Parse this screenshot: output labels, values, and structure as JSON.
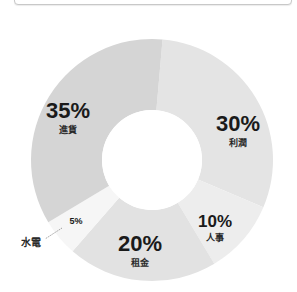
{
  "chart_data": {
    "type": "pie",
    "variant": "donut",
    "title": "",
    "categories": [
      "利潤",
      "人事",
      "租金",
      "水電",
      "進貨"
    ],
    "values": [
      30,
      10,
      20,
      5,
      35
    ],
    "unit": "%",
    "labels": [
      "30%",
      "10%",
      "20%",
      "5%",
      "35%"
    ],
    "colors": [
      "#e4e4e4",
      "#ededed",
      "#e2e2e2",
      "#f6f6f6",
      "#d5d5d5"
    ],
    "start_angle_deg": 5,
    "direction": "clockwise",
    "legend": "none",
    "annotations": [
      {
        "text": "水電",
        "leader_line": true,
        "points_to": "5%"
      }
    ]
  },
  "slices": [
    {
      "pct": "30%",
      "name": "利潤"
    },
    {
      "pct": "10%",
      "name": "人事"
    },
    {
      "pct": "20%",
      "name": "租金"
    },
    {
      "pct": "5%",
      "name": "水電"
    },
    {
      "pct": "35%",
      "name": "進貨"
    }
  ]
}
